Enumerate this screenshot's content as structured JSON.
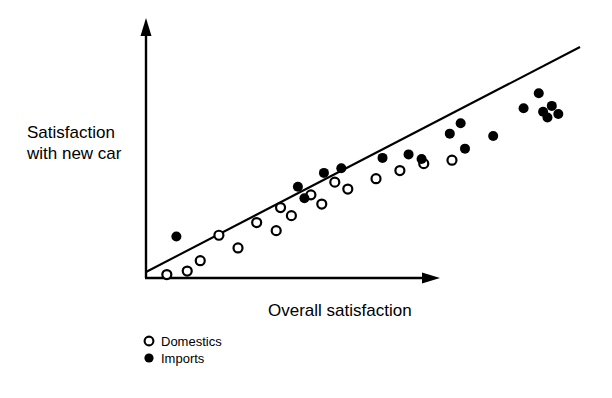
{
  "chart_data": {
    "type": "scatter",
    "title": "",
    "xlabel": "Overall satisfaction",
    "ylabel": "Satisfaction with new car",
    "ylabel_lines": [
      "Satisfaction",
      "with new car"
    ],
    "grid": false,
    "axis_ticks": false,
    "axis_style": "arrow-headed L-shaped axes, no tick labels",
    "xlim": [
      0,
      100
    ],
    "ylim": [
      0,
      100
    ],
    "legend_position": "below-left",
    "annotations": [],
    "trendline": {
      "name": "fitted regression line",
      "color": "#000000",
      "x_start": 0.0,
      "y_start": 2.0,
      "x_end": 100.0,
      "y_end": 89.0
    },
    "series": [
      {
        "name": "Domestics",
        "marker": "open-circle",
        "color": "#000000",
        "fill": "#ffffff",
        "points": [
          {
            "x": 4.8,
            "y": 1.5
          },
          {
            "x": 9.5,
            "y": 3.0
          },
          {
            "x": 12.5,
            "y": 7.5
          },
          {
            "x": 16.8,
            "y": 18.5
          },
          {
            "x": 21.2,
            "y": 13.0
          },
          {
            "x": 25.5,
            "y": 24.0
          },
          {
            "x": 30.0,
            "y": 20.5
          },
          {
            "x": 31.0,
            "y": 30.5
          },
          {
            "x": 33.5,
            "y": 27.0
          },
          {
            "x": 38.0,
            "y": 36.0
          },
          {
            "x": 40.5,
            "y": 32.0
          },
          {
            "x": 43.5,
            "y": 41.5
          },
          {
            "x": 46.5,
            "y": 38.5
          },
          {
            "x": 53.0,
            "y": 43.0
          },
          {
            "x": 58.5,
            "y": 46.5
          },
          {
            "x": 64.0,
            "y": 49.5
          },
          {
            "x": 70.5,
            "y": 51.0
          }
        ]
      },
      {
        "name": "Imports",
        "marker": "filled-circle",
        "color": "#000000",
        "fill": "#000000",
        "points": [
          {
            "x": 7.0,
            "y": 18.0
          },
          {
            "x": 35.0,
            "y": 39.5
          },
          {
            "x": 36.5,
            "y": 34.5
          },
          {
            "x": 41.0,
            "y": 45.5
          },
          {
            "x": 45.0,
            "y": 47.5
          },
          {
            "x": 54.5,
            "y": 52.0
          },
          {
            "x": 60.5,
            "y": 53.5
          },
          {
            "x": 63.5,
            "y": 51.5
          },
          {
            "x": 70.0,
            "y": 62.5
          },
          {
            "x": 72.5,
            "y": 67.0
          },
          {
            "x": 73.5,
            "y": 56.0
          },
          {
            "x": 80.0,
            "y": 61.5
          },
          {
            "x": 87.0,
            "y": 73.5
          },
          {
            "x": 90.5,
            "y": 80.0
          },
          {
            "x": 91.5,
            "y": 72.0
          },
          {
            "x": 93.5,
            "y": 74.5
          },
          {
            "x": 92.5,
            "y": 69.5
          },
          {
            "x": 95.0,
            "y": 71.0
          }
        ]
      }
    ]
  },
  "legend": {
    "items": [
      {
        "label": "Domestics",
        "marker": "open-circle"
      },
      {
        "label": "Imports",
        "marker": "filled-circle"
      }
    ]
  }
}
